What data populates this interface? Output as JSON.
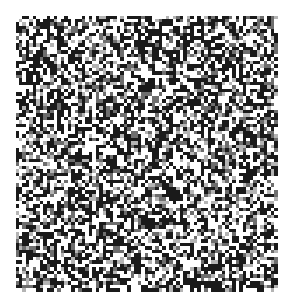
{
  "image": {
    "description": "random black and white noise pattern",
    "background": "#ffffff",
    "pattern": {
      "left": 16,
      "top": 16,
      "width": 262,
      "height": 276,
      "cols": 75,
      "rows": 79,
      "colors": [
        "#1a1a1a",
        "#ffffff",
        "#6e6e6e",
        "#b4b4b4"
      ],
      "weights": [
        0.42,
        0.38,
        0.12,
        0.08
      ],
      "seed": 1337
    }
  }
}
